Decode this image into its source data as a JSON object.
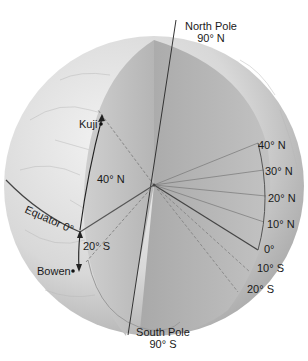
{
  "diagram": {
    "poles": {
      "north": {
        "name": "North Pole",
        "latitude": "90° N"
      },
      "south": {
        "name": "South Pole",
        "latitude": "90° S"
      }
    },
    "places": [
      {
        "name": "Kuji",
        "marker": "dot"
      },
      {
        "name": "Bowen",
        "marker": "dot"
      }
    ],
    "equator_label": "Equator 0°",
    "arc_labels": {
      "north_arc": "40° N",
      "south_arc": "20° S"
    },
    "latitude_scale": [
      "40° N",
      "30° N",
      "20° N",
      "10° N",
      "0°",
      "10° S",
      "20° S"
    ],
    "colors": {
      "globe_surface": "#d9d9d9",
      "cut_face": "#bdbdbd",
      "lines": "#3a3a3a",
      "text": "#1a1a1a"
    }
  }
}
